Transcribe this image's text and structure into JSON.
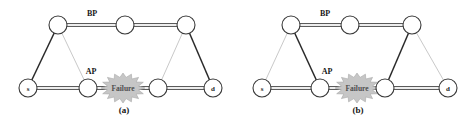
{
  "figure": {
    "type": "network-diagram",
    "panels": [
      {
        "id": "a",
        "caption": "(a)",
        "caption_x": 124,
        "caption_y": 113,
        "path_labels": [
          {
            "text": "BP",
            "x": 92,
            "y": 16
          },
          {
            "text": "AP",
            "x": 91,
            "y": 74
          }
        ],
        "failure": {
          "label": "Failure",
          "x": 123,
          "y": 88,
          "rx": 22,
          "ry": 15
        },
        "nodes": [
          {
            "name": "source",
            "label": "s",
            "x": 28,
            "y": 88,
            "r": 9
          },
          {
            "name": "upper-left",
            "label": "",
            "x": 58,
            "y": 25,
            "r": 9
          },
          {
            "name": "upper-mid",
            "label": "",
            "x": 125,
            "y": 25,
            "r": 9
          },
          {
            "name": "upper-right",
            "label": "",
            "x": 186,
            "y": 25,
            "r": 9
          },
          {
            "name": "lower-mid-left",
            "label": "",
            "x": 88,
            "y": 88,
            "r": 9
          },
          {
            "name": "lower-mid-right",
            "label": "",
            "x": 158,
            "y": 88,
            "r": 9
          },
          {
            "name": "destination",
            "label": "d",
            "x": 213,
            "y": 88,
            "r": 9
          }
        ],
        "edges": [
          {
            "from": "source",
            "to": "upper-left",
            "style": "primary"
          },
          {
            "from": "upper-left",
            "to": "upper-mid",
            "style": "double"
          },
          {
            "from": "upper-mid",
            "to": "upper-right",
            "style": "double"
          },
          {
            "from": "upper-right",
            "to": "destination",
            "style": "primary"
          },
          {
            "from": "source",
            "to": "lower-mid-left",
            "style": "double"
          },
          {
            "from": "lower-mid-left",
            "to": "lower-mid-right",
            "style": "double"
          },
          {
            "from": "lower-mid-right",
            "to": "destination",
            "style": "double"
          },
          {
            "from": "upper-left",
            "to": "lower-mid-left",
            "style": "light"
          },
          {
            "from": "upper-right",
            "to": "lower-mid-right",
            "style": "light"
          }
        ]
      },
      {
        "id": "b",
        "caption": "(b)",
        "caption_x": 358,
        "caption_y": 113,
        "path_labels": [
          {
            "text": "BP",
            "x": 325,
            "y": 16
          },
          {
            "text": "AP",
            "x": 327,
            "y": 74
          }
        ],
        "failure": {
          "label": "Failure",
          "x": 357,
          "y": 88,
          "rx": 22,
          "ry": 15
        },
        "nodes": [
          {
            "name": "source",
            "label": "s",
            "x": 262,
            "y": 88,
            "r": 9
          },
          {
            "name": "upper-left",
            "label": "",
            "x": 291,
            "y": 25,
            "r": 9
          },
          {
            "name": "upper-mid",
            "label": "",
            "x": 350,
            "y": 25,
            "r": 9
          },
          {
            "name": "upper-right",
            "label": "",
            "x": 412,
            "y": 25,
            "r": 9
          },
          {
            "name": "lower-mid-left",
            "label": "",
            "x": 320,
            "y": 88,
            "r": 9
          },
          {
            "name": "lower-mid-right",
            "label": "",
            "x": 385,
            "y": 88,
            "r": 9
          },
          {
            "name": "destination",
            "label": "d",
            "x": 448,
            "y": 88,
            "r": 9
          }
        ],
        "edges": [
          {
            "from": "source",
            "to": "upper-left",
            "style": "light"
          },
          {
            "from": "upper-left",
            "to": "upper-mid",
            "style": "double"
          },
          {
            "from": "upper-mid",
            "to": "upper-right",
            "style": "double"
          },
          {
            "from": "upper-right",
            "to": "destination",
            "style": "light"
          },
          {
            "from": "source",
            "to": "lower-mid-left",
            "style": "double"
          },
          {
            "from": "lower-mid-left",
            "to": "lower-mid-right",
            "style": "double"
          },
          {
            "from": "lower-mid-right",
            "to": "destination",
            "style": "double"
          },
          {
            "from": "upper-left",
            "to": "lower-mid-left",
            "style": "primary"
          },
          {
            "from": "upper-right",
            "to": "lower-mid-right",
            "style": "primary"
          }
        ]
      }
    ],
    "colors": {
      "primary_edge": "#2a2a2a",
      "double_edge": "#4a4a4a",
      "light_edge": "#c9c9c9",
      "node_stroke": "#3a3a3a",
      "burst_fill": "#c6c6c6",
      "burst_text": "#4e4e4e",
      "background": "#ffffff"
    }
  }
}
